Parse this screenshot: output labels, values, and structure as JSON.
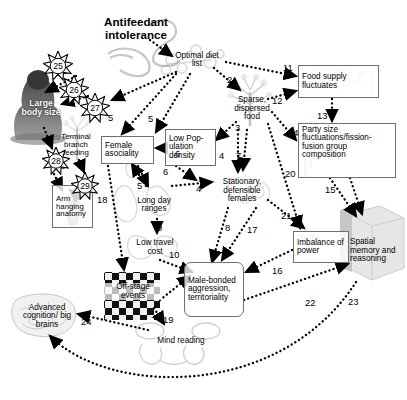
{
  "diagram": {
    "title": "Antifeedant intolerance",
    "type": "causal-flow-diagram",
    "background": "#ffffff"
  },
  "nodes": [
    {
      "id": "antifeedant",
      "label": "Antifeedant intolerance",
      "style": "title",
      "x": 88,
      "y": 17,
      "w": 96,
      "h": 28
    },
    {
      "id": "optimal-diet",
      "label": "Optimal diet list",
      "style": "free",
      "x": 170,
      "y": 48,
      "w": 54,
      "h": 24
    },
    {
      "id": "large-body",
      "label": "Large body size",
      "style": "free",
      "x": 22,
      "y": 88,
      "w": 38,
      "h": 38
    },
    {
      "id": "terminal-branch",
      "label": "Terminal branch feeding",
      "style": "free",
      "x": 53,
      "y": 128,
      "w": 44,
      "h": 33
    },
    {
      "id": "arm-hanging",
      "label": "Arm hanging anatomy",
      "style": "box",
      "x": 52,
      "y": 185,
      "w": 40,
      "h": 42
    },
    {
      "id": "female-asociality",
      "label": "Female asociality",
      "style": "box",
      "x": 101,
      "y": 136,
      "w": 52,
      "h": 27
    },
    {
      "id": "low-pop-density",
      "label": "Low Pop- ulation density",
      "style": "box",
      "x": 165,
      "y": 129,
      "w": 50,
      "h": 36
    },
    {
      "id": "sparse-food",
      "label": "Sparse, dispersed food",
      "style": "free",
      "x": 228,
      "y": 90,
      "w": 50,
      "h": 36
    },
    {
      "id": "food-supply",
      "label": "Food supply fluctuates",
      "style": "box",
      "x": 298,
      "y": 65,
      "w": 80,
      "h": 32
    },
    {
      "id": "party-size",
      "label": "Party size fluctuations/fission-fusion group composition",
      "style": "box",
      "x": 298,
      "y": 123,
      "w": 97,
      "h": 54
    },
    {
      "id": "long-day-ranges",
      "label": "Long day ranges",
      "style": "free",
      "x": 127,
      "y": 190,
      "w": 53,
      "h": 29
    },
    {
      "id": "low-travel-cost",
      "label": "Low travel cost",
      "style": "free",
      "x": 129,
      "y": 234,
      "w": 50,
      "h": 26
    },
    {
      "id": "stationary-females",
      "label": "Stationary, defensible females",
      "style": "free",
      "x": 216,
      "y": 174,
      "w": 54,
      "h": 32
    },
    {
      "id": "male-bonded",
      "label": "Male-bonded aggression, territoriality",
      "style": "rbox",
      "x": 184,
      "y": 262,
      "w": 58,
      "h": 54
    },
    {
      "id": "imbalance-power",
      "label": "Imbalance of power",
      "style": "box",
      "x": 293,
      "y": 231,
      "w": 55,
      "h": 31
    },
    {
      "id": "spatial-memory",
      "label": "Spatial memory and reasoning",
      "style": "free",
      "x": 350,
      "y": 223,
      "w": 50,
      "h": 56
    },
    {
      "id": "offstage-events",
      "label": "Off-stage events",
      "style": "free",
      "x": 105,
      "y": 275,
      "w": 56,
      "h": 32
    },
    {
      "id": "mind-reading",
      "label": "Mind reading",
      "style": "free",
      "x": 155,
      "y": 327,
      "w": 50,
      "h": 28
    },
    {
      "id": "advanced-cognition",
      "label": "Advanced cognition/ big brains",
      "style": "free",
      "x": 18,
      "y": 297,
      "w": 58,
      "h": 38
    }
  ],
  "edge_labels": [
    {
      "n": "1",
      "x": 163,
      "y": 44
    },
    {
      "n": "2",
      "x": 227,
      "y": 74
    },
    {
      "n": "3",
      "x": 235,
      "y": 122
    },
    {
      "n": "4",
      "x": 219,
      "y": 150
    },
    {
      "n": "4",
      "x": 196,
      "y": 183
    },
    {
      "n": "5",
      "x": 108,
      "y": 112
    },
    {
      "n": "5",
      "x": 148,
      "y": 113
    },
    {
      "n": "5",
      "x": 137,
      "y": 180
    },
    {
      "n": "6",
      "x": 175,
      "y": 148
    },
    {
      "n": "6",
      "x": 163,
      "y": 166
    },
    {
      "n": "7",
      "x": 236,
      "y": 150
    },
    {
      "n": "8",
      "x": 225,
      "y": 222
    },
    {
      "n": "9",
      "x": 157,
      "y": 222
    },
    {
      "n": "10",
      "x": 169,
      "y": 249
    },
    {
      "n": "11",
      "x": 283,
      "y": 62
    },
    {
      "n": "12",
      "x": 272,
      "y": 95
    },
    {
      "n": "13",
      "x": 317,
      "y": 110
    },
    {
      "n": "14",
      "x": 288,
      "y": 127
    },
    {
      "n": "15",
      "x": 325,
      "y": 184
    },
    {
      "n": "16",
      "x": 272,
      "y": 265
    },
    {
      "n": "17",
      "x": 247,
      "y": 224
    },
    {
      "n": "18",
      "x": 97,
      "y": 194
    },
    {
      "n": "19",
      "x": 163,
      "y": 314
    },
    {
      "n": "20",
      "x": 285,
      "y": 168
    },
    {
      "n": "21",
      "x": 281,
      "y": 210
    },
    {
      "n": "22",
      "x": 305,
      "y": 297
    },
    {
      "n": "23",
      "x": 348,
      "y": 296
    },
    {
      "n": "24",
      "x": 81,
      "y": 316
    },
    {
      "n": "25",
      "x": 58,
      "y": 65
    },
    {
      "n": "26",
      "x": 72,
      "y": 88
    },
    {
      "n": "27",
      "x": 93,
      "y": 106
    },
    {
      "n": "28",
      "x": 55,
      "y": 160
    },
    {
      "n": "29",
      "x": 83,
      "y": 184
    }
  ],
  "bursts": [
    {
      "n": "25",
      "cx": 58,
      "cy": 66,
      "r": 15
    },
    {
      "n": "26",
      "cx": 74,
      "cy": 90,
      "r": 15
    },
    {
      "n": "27",
      "cx": 95,
      "cy": 108,
      "r": 15
    },
    {
      "n": "28",
      "cx": 56,
      "cy": 161,
      "r": 14
    },
    {
      "n": "29",
      "cx": 85,
      "cy": 186,
      "r": 14
    }
  ],
  "style": {
    "edge_color": "#000000",
    "edge_style": "dotted",
    "box_border": "#6f6f6f",
    "text_color": "#000000"
  }
}
